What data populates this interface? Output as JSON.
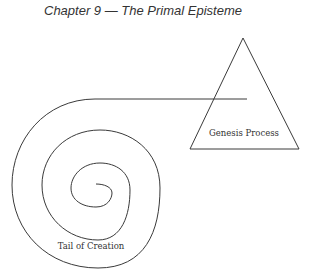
{
  "header": {
    "title": "Chapter 9 — The Primal Episteme"
  },
  "diagram": {
    "triangle_label": "Genesis Process",
    "spiral_label": "Tail of Creation",
    "stroke_color": "#3a3a3a"
  }
}
